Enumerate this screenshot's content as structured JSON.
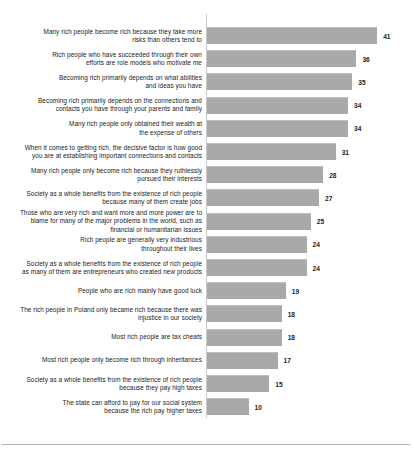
{
  "chart_data": {
    "type": "bar",
    "orientation": "horizontal",
    "title": "",
    "subtitle": "",
    "xlabel": "",
    "ylabel": "",
    "xlim": [
      0,
      41
    ],
    "grid": false,
    "legend": null,
    "bar_color": "#a9a9a9",
    "categories": [
      "Many rich people become rich because they take more\nrisks than others tend to",
      "Rich people who have succeeded through their own\nefforts are role models who motivate me",
      "Becoming rich primarily depends on what abilities\nand ideas you have",
      "Becoming rich primarily depends on the connections and\ncontacts you have through your parents and family",
      "Many rich people only obtained their wealth at\nthe expense of others",
      "When it comes to getting rich, the decisive factor is how good\nyou are at establishing important connections and contacts",
      "Many rich people only become rich because they ruthlessly\npursued their interests",
      "Society as a whole benefits from the existence of rich people\nbecause many of them create jobs",
      "Those who are very rich and want more and more power are to\nblame for many of the major problems in the world, such as\nfinancial or humanitarian issues",
      "Rich people are generally very industrious\nthroughout their lives",
      "Society as a whole benefits from the existence of rich people\nas many of them are entrepreneurs who created new products",
      "People who are rich mainly have good luck",
      "The rich people in Poland only became rich because there was\ninjustice in our society",
      "Most rich people are tax cheats",
      "Most rich people only become rich through inheritances",
      "Society as a whole benefits from the existence of rich people\nbecause they pay high taxes",
      "The state can afford to pay for our social system\nbecause the rich pay higher taxes"
    ],
    "values": [
      41,
      36,
      35,
      34,
      34,
      31,
      28,
      27,
      25,
      24,
      24,
      19,
      18,
      18,
      17,
      15,
      10
    ],
    "value_labels": [
      "41",
      "36",
      "35",
      "34",
      "34",
      "31",
      "28",
      "27",
      "25",
      "24",
      "24",
      "19",
      "18",
      "18",
      "17",
      "15",
      "10"
    ]
  }
}
